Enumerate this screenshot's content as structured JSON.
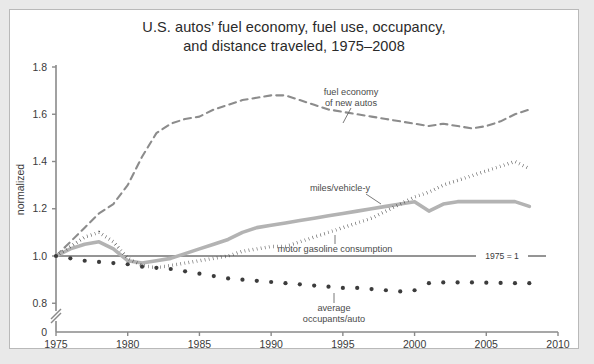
{
  "chart_data": {
    "type": "line",
    "title": "U.S. autos’ fuel economy, fuel use, occupancy,",
    "title_line2": "and distance traveled, 1975–2008",
    "xlabel": "",
    "ylabel": "normalized",
    "xlim": [
      1975,
      2010
    ],
    "ylim": [
      0.8,
      1.8
    ],
    "grid": false,
    "legend_position": "inline-annotations",
    "xticks": [
      1975,
      1980,
      1985,
      1990,
      1995,
      2000,
      2005,
      2010
    ],
    "yticks": [
      "1.8",
      "1.6",
      "1.4",
      "1.2",
      "1.0",
      "0.8",
      "0"
    ],
    "axis_break": true,
    "axis_break_note": "y-axis broken between 0.8 and 0",
    "reference_line": {
      "value": 1.0,
      "label": "1975 = 1"
    },
    "annotations": [
      {
        "name": "fuel-economy-annotation",
        "line1": "fuel economy",
        "line2": "of new autos"
      },
      {
        "name": "miles-per-vehicle-annotation",
        "line1": "miles/vehicle-y",
        "line2": ""
      },
      {
        "name": "gasoline-annotation",
        "line1": "motor gasoline consumption",
        "line2": ""
      },
      {
        "name": "occupants-annotation",
        "line1": "average",
        "line2": "occupants/auto"
      }
    ],
    "series": [
      {
        "name": "fuel economy of new autos",
        "style": "dashed",
        "color": "#8c8c8c",
        "x": [
          1975,
          1976,
          1977,
          1978,
          1979,
          1980,
          1981,
          1982,
          1983,
          1984,
          1985,
          1986,
          1987,
          1988,
          1989,
          1990,
          1991,
          1992,
          1993,
          1994,
          1995,
          1996,
          1997,
          1998,
          1999,
          2000,
          2001,
          2002,
          2003,
          2004,
          2005,
          2006,
          2007,
          2008
        ],
        "values": [
          1.0,
          1.06,
          1.12,
          1.18,
          1.22,
          1.3,
          1.42,
          1.52,
          1.56,
          1.58,
          1.59,
          1.62,
          1.64,
          1.66,
          1.67,
          1.68,
          1.68,
          1.66,
          1.64,
          1.62,
          1.61,
          1.6,
          1.59,
          1.58,
          1.57,
          1.56,
          1.55,
          1.56,
          1.55,
          1.54,
          1.55,
          1.57,
          1.6,
          1.62
        ]
      },
      {
        "name": "miles/vehicle-y",
        "style": "solid-thick",
        "color": "#b3b3b3",
        "x": [
          1975,
          1976,
          1977,
          1978,
          1979,
          1980,
          1981,
          1982,
          1983,
          1984,
          1985,
          1986,
          1987,
          1988,
          1989,
          1990,
          1991,
          1992,
          1993,
          1994,
          1995,
          1996,
          1997,
          1998,
          1999,
          2000,
          2001,
          2002,
          2003,
          2004,
          2005,
          2006,
          2007,
          2008
        ],
        "values": [
          1.0,
          1.03,
          1.05,
          1.06,
          1.03,
          0.98,
          0.97,
          0.98,
          0.99,
          1.01,
          1.03,
          1.05,
          1.07,
          1.1,
          1.12,
          1.13,
          1.14,
          1.15,
          1.16,
          1.17,
          1.18,
          1.19,
          1.2,
          1.21,
          1.22,
          1.23,
          1.19,
          1.22,
          1.23,
          1.23,
          1.23,
          1.23,
          1.23,
          1.21
        ]
      },
      {
        "name": "motor gasoline consumption",
        "style": "dotted",
        "color": "#3c3c3c",
        "x": [
          1975,
          1976,
          1977,
          1978,
          1979,
          1980,
          1981,
          1982,
          1983,
          1984,
          1985,
          1986,
          1987,
          1988,
          1989,
          1990,
          1991,
          1992,
          1993,
          1994,
          1995,
          1996,
          1997,
          1998,
          1999,
          2000,
          2001,
          2002,
          2003,
          2004,
          2005,
          2006,
          2007,
          2008
        ],
        "values": [
          1.0,
          1.04,
          1.08,
          1.1,
          1.06,
          0.99,
          0.96,
          0.95,
          0.96,
          0.97,
          0.98,
          0.99,
          1.0,
          1.02,
          1.03,
          1.04,
          1.04,
          1.06,
          1.08,
          1.1,
          1.12,
          1.14,
          1.16,
          1.19,
          1.22,
          1.25,
          1.27,
          1.3,
          1.32,
          1.34,
          1.36,
          1.38,
          1.4,
          1.37
        ]
      },
      {
        "name": "average occupants/auto",
        "style": "dotted-sparse",
        "color": "#3c3c3c",
        "x": [
          1975,
          1976,
          1977,
          1978,
          1979,
          1980,
          1981,
          1982,
          1983,
          1984,
          1985,
          1986,
          1987,
          1988,
          1989,
          1990,
          1991,
          1992,
          1993,
          1994,
          1995,
          1996,
          1997,
          1998,
          1999,
          2000,
          2001,
          2002,
          2003,
          2004,
          2005,
          2006,
          2007,
          2008
        ],
        "values": [
          1.0,
          0.99,
          0.98,
          0.975,
          0.97,
          0.965,
          0.955,
          0.95,
          0.945,
          0.935,
          0.925,
          0.915,
          0.905,
          0.9,
          0.895,
          0.89,
          0.885,
          0.88,
          0.875,
          0.87,
          0.865,
          0.865,
          0.86,
          0.855,
          0.85,
          0.855,
          0.885,
          0.888,
          0.888,
          0.888,
          0.887,
          0.886,
          0.885,
          0.885
        ]
      }
    ]
  }
}
